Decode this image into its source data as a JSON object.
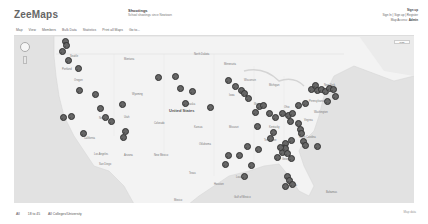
{
  "header": {
    "logo": "ZeeMaps",
    "map_title": "Shootings",
    "map_subtitle": "School shootings since Newtown",
    "account": {
      "line1": "Sign up",
      "line2": "Sign In | Sign up | Register",
      "line3_label": "Map Access:",
      "line3_value": "Admin"
    }
  },
  "menubar": {
    "items": [
      "Map",
      "View",
      "Members",
      "Bulk Data",
      "Statistics",
      "Print all Maps",
      "Go to..."
    ]
  },
  "map": {
    "country_label": "United States",
    "maptype_label": "Map",
    "marker_color": "#666666",
    "water_color": "#e2e2e2",
    "land_color": "#f3f3f3",
    "city_labels": [
      {
        "text": "Seattle",
        "x": 56,
        "y": 19
      },
      {
        "text": "Portland",
        "x": 48,
        "y": 32
      },
      {
        "text": "Oregon",
        "x": 60,
        "y": 43
      },
      {
        "text": "Montana",
        "x": 110,
        "y": 22
      },
      {
        "text": "North Dakota",
        "x": 180,
        "y": 17
      },
      {
        "text": "Minnesota",
        "x": 210,
        "y": 27
      },
      {
        "text": "Wisconsin",
        "x": 230,
        "y": 43
      },
      {
        "text": "Michigan",
        "x": 255,
        "y": 48
      },
      {
        "text": "Wyoming",
        "x": 118,
        "y": 57
      },
      {
        "text": "Nebraska",
        "x": 170,
        "y": 67
      },
      {
        "text": "Iowa",
        "x": 215,
        "y": 58
      },
      {
        "text": "Illinois",
        "x": 240,
        "y": 67
      },
      {
        "text": "Ohio",
        "x": 270,
        "y": 70
      },
      {
        "text": "Pennsylvania",
        "x": 295,
        "y": 64
      },
      {
        "text": "New York",
        "x": 310,
        "y": 48
      },
      {
        "text": "Nevada",
        "x": 85,
        "y": 81
      },
      {
        "text": "Utah",
        "x": 110,
        "y": 80
      },
      {
        "text": "Colorado",
        "x": 140,
        "y": 86
      },
      {
        "text": "Kansas",
        "x": 180,
        "y": 90
      },
      {
        "text": "Missouri",
        "x": 215,
        "y": 90
      },
      {
        "text": "Kentucky",
        "x": 255,
        "y": 90
      },
      {
        "text": "Virginia",
        "x": 290,
        "y": 83
      },
      {
        "text": "California",
        "x": 70,
        "y": 101
      },
      {
        "text": "Arizona",
        "x": 110,
        "y": 118
      },
      {
        "text": "New Mexico",
        "x": 140,
        "y": 118
      },
      {
        "text": "Oklahoma",
        "x": 185,
        "y": 107
      },
      {
        "text": "Tennessee",
        "x": 250,
        "y": 103
      },
      {
        "text": "North Carolina",
        "x": 285,
        "y": 100
      },
      {
        "text": "Texas",
        "x": 175,
        "y": 136
      },
      {
        "text": "Louisiana",
        "x": 222,
        "y": 140
      },
      {
        "text": "Georgia",
        "x": 268,
        "y": 122
      },
      {
        "text": "Florida",
        "x": 275,
        "y": 148
      },
      {
        "text": "Los Angeles",
        "x": 80,
        "y": 117
      },
      {
        "text": "San Diego",
        "x": 85,
        "y": 127
      },
      {
        "text": "Mexico",
        "x": 160,
        "y": 163
      },
      {
        "text": "Gulf of Mexico",
        "x": 220,
        "y": 160
      },
      {
        "text": "Bahamas",
        "x": 312,
        "y": 155
      },
      {
        "text": "Houston",
        "x": 200,
        "y": 147
      },
      {
        "text": "Washington",
        "x": 300,
        "y": 75
      }
    ],
    "country_label_pos": {
      "x": 155,
      "y": 72
    },
    "markers": [
      [
        50,
        8
      ],
      [
        51,
        12
      ],
      [
        47,
        18
      ],
      [
        53,
        27
      ],
      [
        63,
        35
      ],
      [
        64,
        57
      ],
      [
        80,
        61
      ],
      [
        85,
        75
      ],
      [
        90,
        84
      ],
      [
        96,
        88
      ],
      [
        107,
        71
      ],
      [
        48,
        84
      ],
      [
        56,
        83
      ],
      [
        68,
        100
      ],
      [
        108,
        104
      ],
      [
        143,
        44
      ],
      [
        160,
        43
      ],
      [
        165,
        55
      ],
      [
        177,
        58
      ],
      [
        170,
        70
      ],
      [
        195,
        74
      ],
      [
        213,
        47
      ],
      [
        220,
        53
      ],
      [
        226,
        57
      ],
      [
        229,
        60
      ],
      [
        233,
        65
      ],
      [
        240,
        79
      ],
      [
        244,
        73
      ],
      [
        248,
        72
      ],
      [
        242,
        93
      ],
      [
        254,
        80
      ],
      [
        260,
        84
      ],
      [
        267,
        80
      ],
      [
        273,
        82
      ],
      [
        277,
        80
      ],
      [
        275,
        88
      ],
      [
        283,
        72
      ],
      [
        290,
        70
      ],
      [
        296,
        56
      ],
      [
        300,
        52
      ],
      [
        302,
        57
      ],
      [
        306,
        56
      ],
      [
        310,
        58
      ],
      [
        314,
        55
      ],
      [
        318,
        56
      ],
      [
        320,
        63
      ],
      [
        312,
        68
      ],
      [
        283,
        90
      ],
      [
        285,
        96
      ],
      [
        286,
        100
      ],
      [
        276,
        107
      ],
      [
        270,
        110
      ],
      [
        255,
        105
      ],
      [
        258,
        99
      ],
      [
        213,
        122
      ],
      [
        224,
        122
      ],
      [
        243,
        116
      ],
      [
        232,
        113
      ],
      [
        210,
        131
      ],
      [
        236,
        132
      ],
      [
        229,
        143
      ],
      [
        262,
        124
      ],
      [
        267,
        119
      ],
      [
        270,
        115
      ],
      [
        265,
        114
      ],
      [
        272,
        120
      ],
      [
        276,
        125
      ],
      [
        288,
        108
      ],
      [
        290,
        112
      ],
      [
        272,
        143
      ],
      [
        274,
        147
      ],
      [
        277,
        151
      ],
      [
        270,
        153
      ],
      [
        302,
        113
      ],
      [
        110,
        98
      ]
    ]
  },
  "footer": {
    "items": [
      "All",
      "18 to 45",
      "All Colleges/University"
    ],
    "right_text": "Map data"
  }
}
